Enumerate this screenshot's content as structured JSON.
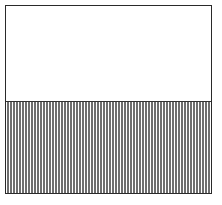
{
  "diagram": {
    "type": "rectangle-split",
    "regions": [
      {
        "name": "top",
        "fill": "none",
        "fraction_of_height": 0.5
      },
      {
        "name": "bottom",
        "fill": "vertical-hatch",
        "fraction_of_height": 0.5
      }
    ],
    "colors": {
      "border": "#2a2a2a",
      "hatch": "#6e6e6e",
      "background": "#ffffff"
    }
  }
}
